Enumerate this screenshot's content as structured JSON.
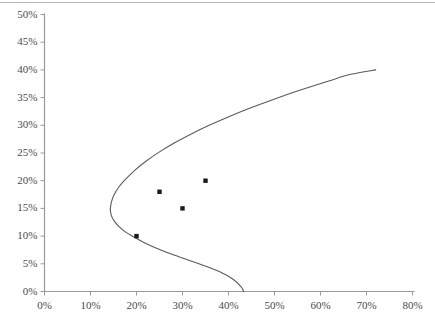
{
  "chart_data": {
    "type": "line",
    "title": "",
    "subtitle": "",
    "xlabel": "",
    "ylabel": "",
    "xlim": [
      0,
      80
    ],
    "ylim": [
      0,
      50
    ],
    "grid": false,
    "legend": "none",
    "x_ticks": [
      "0%",
      "10%",
      "20%",
      "30%",
      "40%",
      "50%",
      "60%",
      "70%",
      "80%"
    ],
    "x_tick_values": [
      0,
      10,
      20,
      30,
      40,
      50,
      60,
      70,
      80
    ],
    "y_ticks": [
      "0%",
      "5%",
      "10%",
      "15%",
      "20%",
      "25%",
      "30%",
      "35%",
      "40%",
      "45%",
      "50%"
    ],
    "y_tick_values": [
      0,
      5,
      10,
      15,
      20,
      25,
      30,
      35,
      40,
      45,
      50
    ],
    "axis_color": "#9a9a9a",
    "curve_color": "#5a5a5a",
    "marker_color": "#1a1a1a",
    "series": [
      {
        "name": "efficient-frontier-upper",
        "type": "line",
        "points": [
          [
            14.3,
            14.8
          ],
          [
            14.5,
            16.0
          ],
          [
            15.1,
            17.4
          ],
          [
            16.2,
            18.9
          ],
          [
            17.8,
            20.4
          ],
          [
            19.8,
            22.0
          ],
          [
            22.2,
            23.6
          ],
          [
            25.0,
            25.2
          ],
          [
            28.2,
            26.8
          ],
          [
            31.8,
            28.4
          ],
          [
            35.8,
            30.0
          ],
          [
            40.2,
            31.6
          ],
          [
            45.0,
            33.2
          ],
          [
            50.2,
            34.8
          ],
          [
            55.8,
            36.4
          ],
          [
            61.8,
            38.0
          ],
          [
            66.6,
            39.2
          ],
          [
            72.0,
            40.0
          ]
        ]
      },
      {
        "name": "efficient-frontier-lower",
        "type": "line",
        "points": [
          [
            14.3,
            14.8
          ],
          [
            14.5,
            13.8
          ],
          [
            15.1,
            12.8
          ],
          [
            16.1,
            11.8
          ],
          [
            17.5,
            10.8
          ],
          [
            19.3,
            9.9
          ],
          [
            21.5,
            8.9
          ],
          [
            24.1,
            7.9
          ],
          [
            27.1,
            6.9
          ],
          [
            30.5,
            5.9
          ],
          [
            34.3,
            4.8
          ],
          [
            38.0,
            3.6
          ],
          [
            41.0,
            2.2
          ],
          [
            42.8,
            0.8
          ],
          [
            43.3,
            0.0
          ]
        ]
      }
    ],
    "scatter_points": [
      {
        "x": 20,
        "y": 10
      },
      {
        "x": 25,
        "y": 18
      },
      {
        "x": 30,
        "y": 15
      },
      {
        "x": 35,
        "y": 20
      }
    ]
  }
}
